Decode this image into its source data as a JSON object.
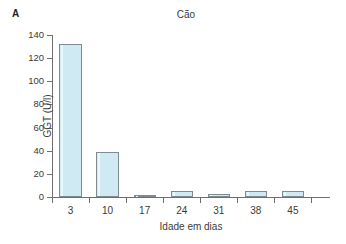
{
  "figure": {
    "panel_label": "A",
    "background_color": "#ffffff"
  },
  "chart_data": {
    "type": "bar",
    "title": "Cão",
    "xlabel": "Idade em dias",
    "ylabel": "GGT (U/l)",
    "categories": [
      "3",
      "10",
      "17",
      "24",
      "31",
      "38",
      "45"
    ],
    "values": [
      132,
      38.5,
      2,
      5.5,
      2.5,
      5,
      5.5
    ],
    "ylim": [
      0,
      140
    ],
    "ytick_labels": [
      "0",
      "20",
      "40",
      "60",
      "80",
      "100",
      "120",
      "140"
    ],
    "ytick_values": [
      0,
      20,
      40,
      60,
      80,
      100,
      120,
      140
    ],
    "grid": false,
    "legend": null,
    "bar_fill_color": "#cfeaf3",
    "bar_edge_color": "#7f8b90",
    "axis_color": "#6f6f6f",
    "text_color": "#3a3a3a"
  }
}
